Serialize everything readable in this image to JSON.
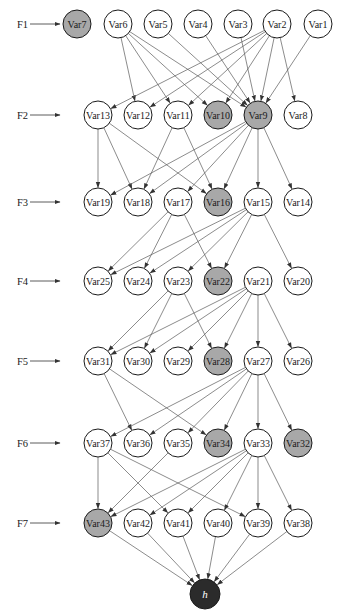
{
  "diagram": {
    "type": "layered-directed-graph",
    "colors": {
      "node_default": "#ffffff",
      "node_highlighted": "#a8a8a8",
      "node_sink": "#2b2b2b",
      "edge": "#5a5a5a",
      "stroke": "#1a1a1a"
    },
    "levels": [
      {
        "label": "F1",
        "y": 24,
        "nodes": [
          {
            "id": "Var7",
            "x": 77,
            "highlighted": true
          },
          {
            "id": "Var6",
            "x": 118,
            "highlighted": false
          },
          {
            "id": "Var5",
            "x": 158,
            "highlighted": false
          },
          {
            "id": "Var4",
            "x": 198,
            "highlighted": false
          },
          {
            "id": "Var3",
            "x": 238,
            "highlighted": false
          },
          {
            "id": "Var2",
            "x": 277,
            "highlighted": false
          },
          {
            "id": "Var1",
            "x": 318,
            "highlighted": false
          }
        ]
      },
      {
        "label": "F2",
        "y": 115,
        "nodes": [
          {
            "id": "Var13",
            "x": 98,
            "highlighted": false
          },
          {
            "id": "Var12",
            "x": 138,
            "highlighted": false
          },
          {
            "id": "Var11",
            "x": 178,
            "highlighted": false
          },
          {
            "id": "Var10",
            "x": 218,
            "highlighted": true
          },
          {
            "id": "Var9",
            "x": 258,
            "highlighted": true
          },
          {
            "id": "Var8",
            "x": 298,
            "highlighted": false
          }
        ]
      },
      {
        "label": "F3",
        "y": 202,
        "nodes": [
          {
            "id": "Var19",
            "x": 98,
            "highlighted": false
          },
          {
            "id": "Var18",
            "x": 138,
            "highlighted": false
          },
          {
            "id": "Var17",
            "x": 178,
            "highlighted": false
          },
          {
            "id": "Var16",
            "x": 218,
            "highlighted": true
          },
          {
            "id": "Var15",
            "x": 258,
            "highlighted": false
          },
          {
            "id": "Var14",
            "x": 298,
            "highlighted": false
          }
        ]
      },
      {
        "label": "F4",
        "y": 281,
        "nodes": [
          {
            "id": "Var25",
            "x": 98,
            "highlighted": false
          },
          {
            "id": "Var24",
            "x": 138,
            "highlighted": false
          },
          {
            "id": "Var23",
            "x": 178,
            "highlighted": false
          },
          {
            "id": "Var22",
            "x": 218,
            "highlighted": true
          },
          {
            "id": "Var21",
            "x": 258,
            "highlighted": false
          },
          {
            "id": "Var20",
            "x": 298,
            "highlighted": false
          }
        ]
      },
      {
        "label": "F5",
        "y": 361,
        "nodes": [
          {
            "id": "Var31",
            "x": 98,
            "highlighted": false
          },
          {
            "id": "Var30",
            "x": 138,
            "highlighted": false
          },
          {
            "id": "Var29",
            "x": 178,
            "highlighted": false
          },
          {
            "id": "Var28",
            "x": 218,
            "highlighted": true
          },
          {
            "id": "Var27",
            "x": 258,
            "highlighted": false
          },
          {
            "id": "Var26",
            "x": 298,
            "highlighted": false
          }
        ]
      },
      {
        "label": "F6",
        "y": 443,
        "nodes": [
          {
            "id": "Var37",
            "x": 98,
            "highlighted": false
          },
          {
            "id": "Var36",
            "x": 138,
            "highlighted": false
          },
          {
            "id": "Var35",
            "x": 178,
            "highlighted": false
          },
          {
            "id": "Var34",
            "x": 218,
            "highlighted": true
          },
          {
            "id": "Var33",
            "x": 258,
            "highlighted": false
          },
          {
            "id": "Var32",
            "x": 298,
            "highlighted": true
          }
        ]
      },
      {
        "label": "F7",
        "y": 523,
        "nodes": [
          {
            "id": "Var43",
            "x": 98,
            "highlighted": true
          },
          {
            "id": "Var42",
            "x": 138,
            "highlighted": false
          },
          {
            "id": "Var41",
            "x": 178,
            "highlighted": false
          },
          {
            "id": "Var40",
            "x": 218,
            "highlighted": false
          },
          {
            "id": "Var39",
            "x": 258,
            "highlighted": false
          },
          {
            "id": "Var38",
            "x": 298,
            "highlighted": false
          }
        ]
      }
    ],
    "sink": {
      "id": "h",
      "label": "h",
      "x": 205,
      "y": 594
    },
    "edges": [
      [
        "Var6",
        "Var12"
      ],
      [
        "Var6",
        "Var11"
      ],
      [
        "Var6",
        "Var10"
      ],
      [
        "Var6",
        "Var9"
      ],
      [
        "Var5",
        "Var9"
      ],
      [
        "Var4",
        "Var9"
      ],
      [
        "Var3",
        "Var9"
      ],
      [
        "Var2",
        "Var13"
      ],
      [
        "Var2",
        "Var12"
      ],
      [
        "Var2",
        "Var11"
      ],
      [
        "Var2",
        "Var10"
      ],
      [
        "Var2",
        "Var9"
      ],
      [
        "Var2",
        "Var8"
      ],
      [
        "Var1",
        "Var9"
      ],
      [
        "Var13",
        "Var19"
      ],
      [
        "Var13",
        "Var18"
      ],
      [
        "Var13",
        "Var16"
      ],
      [
        "Var11",
        "Var18"
      ],
      [
        "Var11",
        "Var16"
      ],
      [
        "Var9",
        "Var19"
      ],
      [
        "Var9",
        "Var18"
      ],
      [
        "Var9",
        "Var17"
      ],
      [
        "Var9",
        "Var16"
      ],
      [
        "Var9",
        "Var15"
      ],
      [
        "Var9",
        "Var14"
      ],
      [
        "Var17",
        "Var25"
      ],
      [
        "Var17",
        "Var24"
      ],
      [
        "Var17",
        "Var22"
      ],
      [
        "Var15",
        "Var25"
      ],
      [
        "Var15",
        "Var24"
      ],
      [
        "Var15",
        "Var23"
      ],
      [
        "Var15",
        "Var22"
      ],
      [
        "Var15",
        "Var20"
      ],
      [
        "Var23",
        "Var31"
      ],
      [
        "Var23",
        "Var30"
      ],
      [
        "Var23",
        "Var28"
      ],
      [
        "Var21",
        "Var31"
      ],
      [
        "Var21",
        "Var30"
      ],
      [
        "Var21",
        "Var29"
      ],
      [
        "Var21",
        "Var28"
      ],
      [
        "Var21",
        "Var27"
      ],
      [
        "Var21",
        "Var26"
      ],
      [
        "Var31",
        "Var36"
      ],
      [
        "Var31",
        "Var34"
      ],
      [
        "Var27",
        "Var37"
      ],
      [
        "Var27",
        "Var36"
      ],
      [
        "Var27",
        "Var35"
      ],
      [
        "Var27",
        "Var34"
      ],
      [
        "Var27",
        "Var33"
      ],
      [
        "Var27",
        "Var32"
      ],
      [
        "Var37",
        "Var43"
      ],
      [
        "Var37",
        "Var41"
      ],
      [
        "Var37",
        "Var39"
      ],
      [
        "Var35",
        "Var43"
      ],
      [
        "Var33",
        "Var43"
      ],
      [
        "Var33",
        "Var42"
      ],
      [
        "Var33",
        "Var41"
      ],
      [
        "Var33",
        "Var40"
      ],
      [
        "Var33",
        "Var39"
      ],
      [
        "Var33",
        "Var38"
      ],
      [
        "Var43",
        "h"
      ],
      [
        "Var42",
        "h"
      ],
      [
        "Var41",
        "h"
      ],
      [
        "Var40",
        "h"
      ],
      [
        "Var39",
        "h"
      ],
      [
        "Var38",
        "h"
      ]
    ],
    "node_radius": 14,
    "sink_radius": 15,
    "level_label_x": 17,
    "level_arrow_start_x": 30,
    "level_arrow_end_x": 60
  }
}
